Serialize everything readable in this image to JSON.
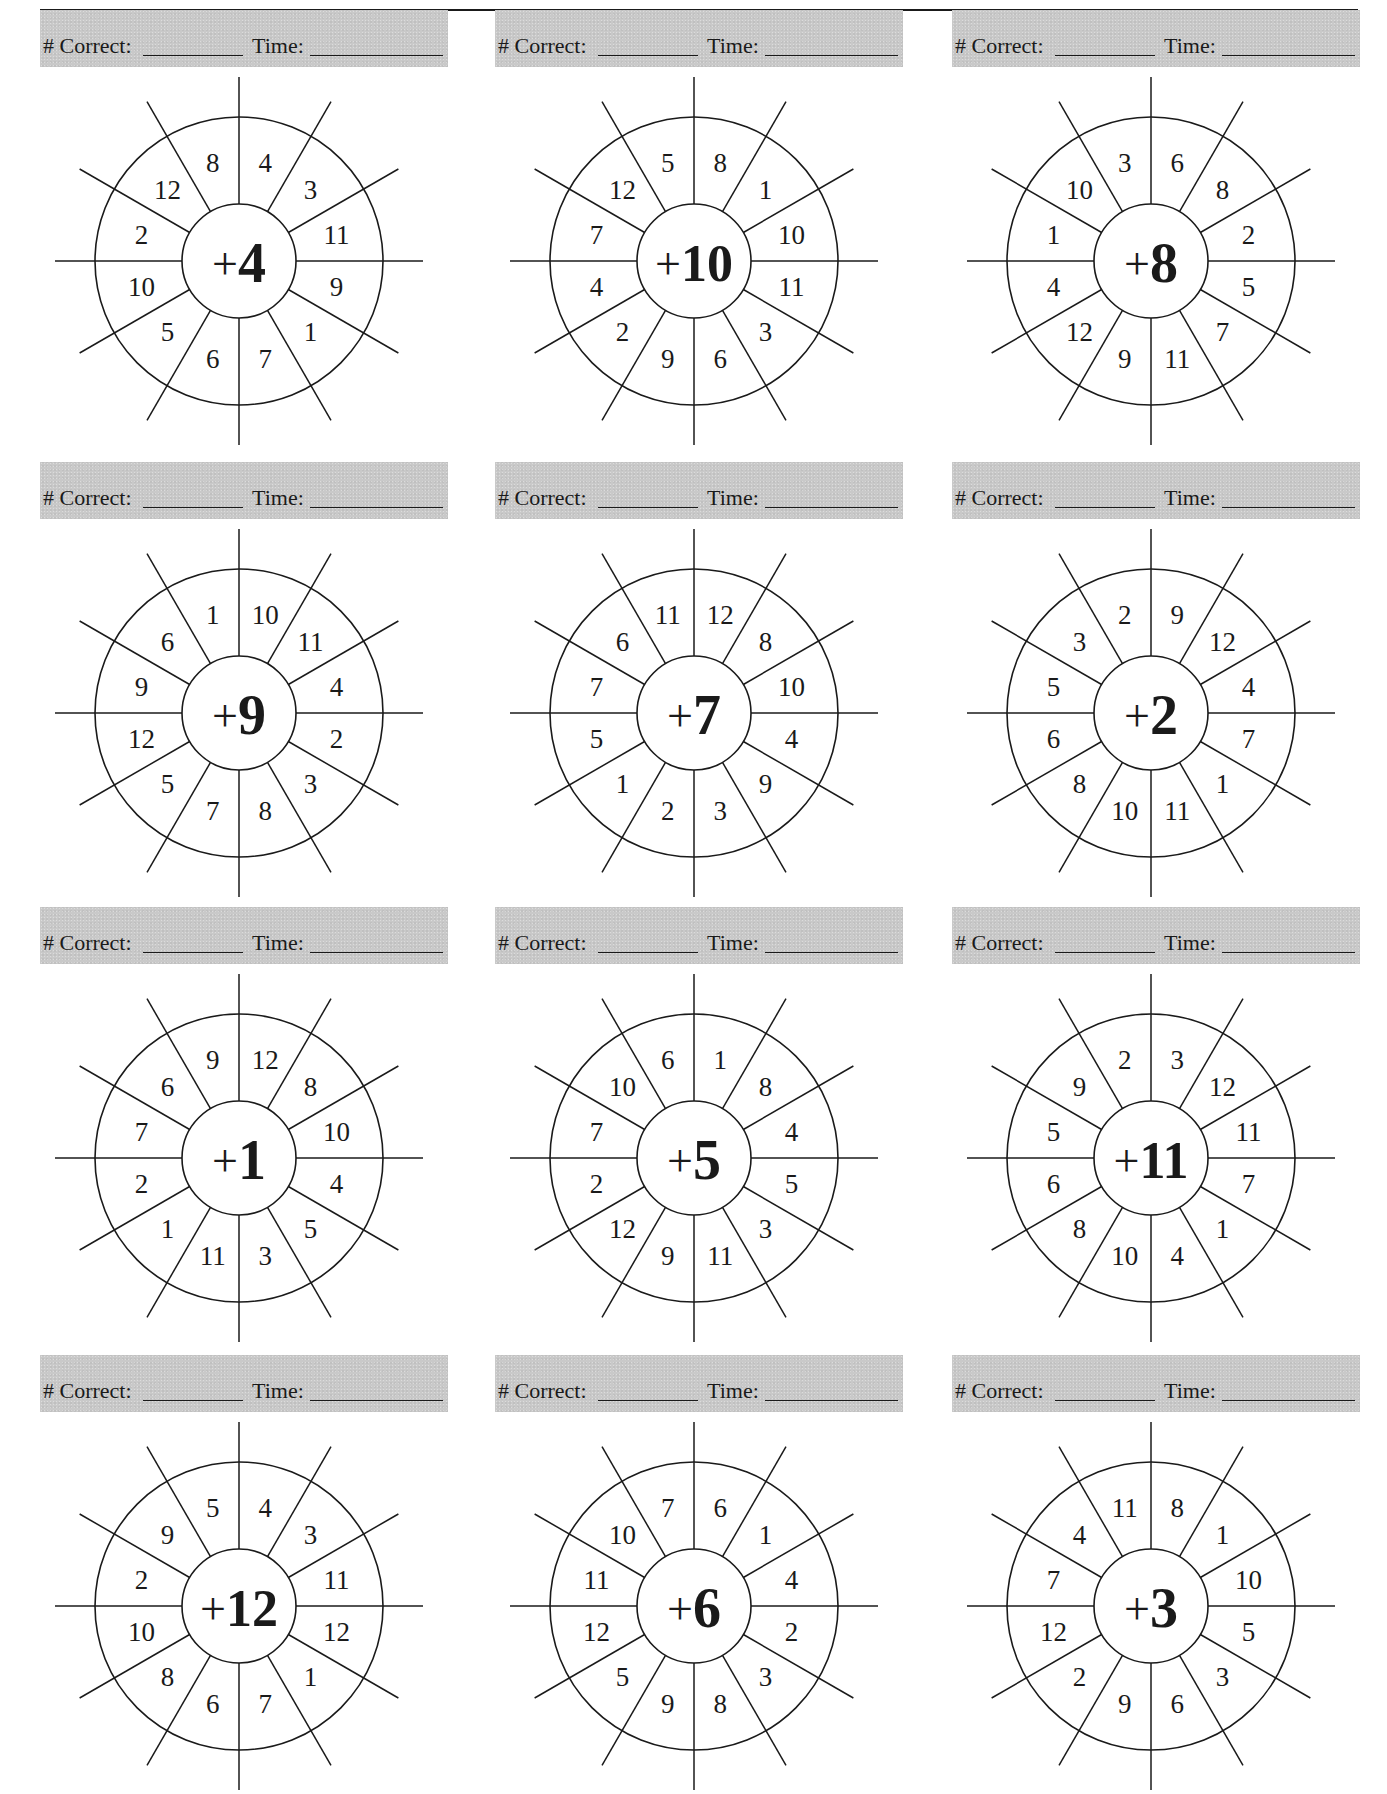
{
  "worksheet": {
    "score_labels": {
      "correct": "# Correct:",
      "time": "Time:"
    },
    "colors": {
      "bar": "#c9c9c9",
      "ink": "#1a1a1a"
    },
    "wheels": [
      {
        "operator": "+",
        "addend": "4",
        "numbers": [
          "4",
          "3",
          "11",
          "9",
          "1",
          "7",
          "6",
          "5",
          "10",
          "2",
          "12",
          "8"
        ]
      },
      {
        "operator": "+",
        "addend": "10",
        "numbers": [
          "8",
          "1",
          "10",
          "11",
          "3",
          "6",
          "9",
          "2",
          "4",
          "7",
          "12",
          "5"
        ]
      },
      {
        "operator": "+",
        "addend": "8",
        "numbers": [
          "6",
          "8",
          "2",
          "5",
          "7",
          "11",
          "9",
          "12",
          "4",
          "1",
          "10",
          "3"
        ]
      },
      {
        "operator": "+",
        "addend": "9",
        "numbers": [
          "10",
          "11",
          "4",
          "2",
          "3",
          "8",
          "7",
          "5",
          "12",
          "9",
          "6",
          "1"
        ]
      },
      {
        "operator": "+",
        "addend": "7",
        "numbers": [
          "12",
          "8",
          "10",
          "4",
          "9",
          "3",
          "2",
          "1",
          "5",
          "7",
          "6",
          "11"
        ]
      },
      {
        "operator": "+",
        "addend": "2",
        "numbers": [
          "9",
          "12",
          "4",
          "7",
          "1",
          "11",
          "10",
          "8",
          "6",
          "5",
          "3",
          "2"
        ]
      },
      {
        "operator": "+",
        "addend": "1",
        "numbers": [
          "12",
          "8",
          "10",
          "4",
          "5",
          "3",
          "11",
          "1",
          "2",
          "7",
          "6",
          "9"
        ]
      },
      {
        "operator": "+",
        "addend": "5",
        "numbers": [
          "1",
          "8",
          "4",
          "5",
          "3",
          "11",
          "9",
          "12",
          "2",
          "7",
          "10",
          "6"
        ]
      },
      {
        "operator": "+",
        "addend": "11",
        "numbers": [
          "3",
          "12",
          "11",
          "7",
          "1",
          "4",
          "10",
          "8",
          "6",
          "5",
          "9",
          "2"
        ]
      },
      {
        "operator": "+",
        "addend": "12",
        "numbers": [
          "4",
          "3",
          "11",
          "12",
          "1",
          "7",
          "6",
          "8",
          "10",
          "2",
          "9",
          "5"
        ]
      },
      {
        "operator": "+",
        "addend": "6",
        "numbers": [
          "6",
          "1",
          "4",
          "2",
          "3",
          "8",
          "9",
          "5",
          "12",
          "11",
          "10",
          "7"
        ]
      },
      {
        "operator": "+",
        "addend": "3",
        "numbers": [
          "8",
          "1",
          "10",
          "5",
          "3",
          "6",
          "9",
          "2",
          "12",
          "7",
          "4",
          "11"
        ]
      }
    ]
  }
}
